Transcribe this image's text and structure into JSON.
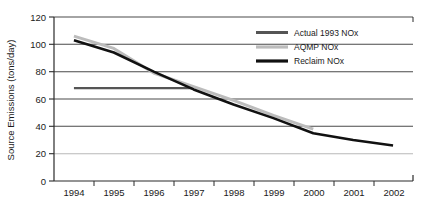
{
  "chart_data": {
    "type": "line",
    "title": "",
    "xlabel": "",
    "ylabel": "Source Emissions (tons/day)",
    "x": [
      "1994",
      "1995",
      "1996",
      "1997",
      "1998",
      "1999",
      "2000",
      "2001",
      "2002"
    ],
    "xlim": [
      "1994",
      "2002"
    ],
    "ylim": [
      0,
      120
    ],
    "yticks": [
      0,
      20,
      40,
      60,
      80,
      100,
      120
    ],
    "ytick_labels": [
      "0",
      "20",
      "40",
      "60",
      "80",
      "100",
      "120"
    ],
    "xtick_labels": [
      "1994",
      "1995",
      "1996",
      "1997",
      "1998",
      "1999",
      "2000",
      "2001",
      "2002"
    ],
    "grid": true,
    "grid_axis": "y",
    "legend_position": "top-right",
    "series": [
      {
        "name": "Actual 1993 NOx",
        "color": "#555555",
        "width": 2.2,
        "x": [
          "1994",
          "1997"
        ],
        "values": [
          68,
          68
        ]
      },
      {
        "name": "AQMP NOx",
        "color": "#bcbcbc",
        "width": 3.0,
        "x": [
          "1994",
          "1995",
          "1996",
          "1997",
          "1998",
          "1999",
          "2000"
        ],
        "values": [
          106,
          97,
          79,
          69,
          59,
          48,
          38
        ]
      },
      {
        "name": "Reclaim NOx",
        "color": "#111111",
        "width": 2.6,
        "x": [
          "1994",
          "1995",
          "1996",
          "1997",
          "1998",
          "1999",
          "2000",
          "2001",
          "2002"
        ],
        "values": [
          103,
          94,
          80,
          67,
          56,
          46,
          35,
          30,
          26
        ]
      }
    ]
  },
  "axes": {
    "y_title": "Source Emissions (tons/day)",
    "y_tick_0": "0",
    "y_tick_20": "20",
    "y_tick_40": "40",
    "y_tick_60": "60",
    "y_tick_80": "80",
    "y_tick_100": "100",
    "y_tick_120": "120",
    "x_tick_1994": "1994",
    "x_tick_1995": "1995",
    "x_tick_1996": "1996",
    "x_tick_1997": "1997",
    "x_tick_1998": "1998",
    "x_tick_1999": "1999",
    "x_tick_2000": "2000",
    "x_tick_2001": "2001",
    "x_tick_2002": "2002"
  },
  "legend": {
    "items": [
      {
        "label": "Actual 1993 NOx",
        "color": "#555555"
      },
      {
        "label": "AQMP NOx",
        "color": "#bcbcbc"
      },
      {
        "label": "Reclaim NOx",
        "color": "#111111"
      }
    ]
  },
  "colors": {
    "background": "#ffffff",
    "axis": "#2b2b2b",
    "gridline": "#4a4a4a",
    "gridline_light": "#b9b9b9",
    "text": "#1a1a1a"
  }
}
